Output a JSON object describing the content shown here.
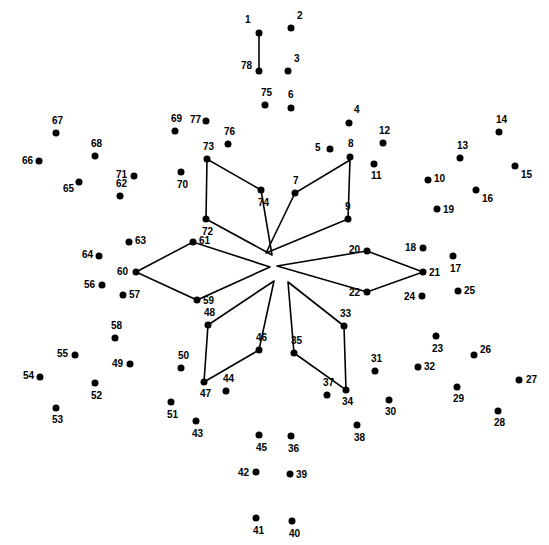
{
  "page": {
    "width": 549,
    "height": 545,
    "background_color": "#ffffff",
    "dot_color": "#000000",
    "line_color": "#000000",
    "label_color": "#000000"
  },
  "dots": [
    {
      "n": "1",
      "x": 259,
      "y": 33,
      "lx": -14,
      "ly": -13
    },
    {
      "n": "2",
      "x": 291,
      "y": 28,
      "lx": 6,
      "ly": -12
    },
    {
      "n": "3",
      "x": 288,
      "y": 71,
      "lx": 6,
      "ly": -12
    },
    {
      "n": "4",
      "x": 349,
      "y": 123,
      "lx": 5,
      "ly": -13
    },
    {
      "n": "5",
      "x": 330,
      "y": 149,
      "lx": -15,
      "ly": -1
    },
    {
      "n": "6",
      "x": 291,
      "y": 108,
      "lx": -3,
      "ly": -13
    },
    {
      "n": "7",
      "x": 295,
      "y": 193,
      "lx": -2,
      "ly": -12
    },
    {
      "n": "8",
      "x": 350,
      "y": 157,
      "lx": -2,
      "ly": -13
    },
    {
      "n": "9",
      "x": 348,
      "y": 219,
      "lx": -3,
      "ly": -12
    },
    {
      "n": "10",
      "x": 428,
      "y": 180,
      "lx": 6,
      "ly": -1
    },
    {
      "n": "11",
      "x": 374,
      "y": 164,
      "lx": -3,
      "ly": 12
    },
    {
      "n": "12",
      "x": 383,
      "y": 143,
      "lx": -4,
      "ly": -12
    },
    {
      "n": "13",
      "x": 460,
      "y": 158,
      "lx": -3,
      "ly": -12
    },
    {
      "n": "14",
      "x": 499,
      "y": 132,
      "lx": -3,
      "ly": -12
    },
    {
      "n": "15",
      "x": 515,
      "y": 166,
      "lx": 6,
      "ly": 9
    },
    {
      "n": "16",
      "x": 476,
      "y": 190,
      "lx": 6,
      "ly": 9
    },
    {
      "n": "17",
      "x": 453,
      "y": 256,
      "lx": -3,
      "ly": 13
    },
    {
      "n": "18",
      "x": 423,
      "y": 248,
      "lx": -18,
      "ly": 0
    },
    {
      "n": "19",
      "x": 437,
      "y": 209,
      "lx": 6,
      "ly": 1
    },
    {
      "n": "20",
      "x": 367,
      "y": 251,
      "lx": -18,
      "ly": -1
    },
    {
      "n": "21",
      "x": 423,
      "y": 272,
      "lx": 6,
      "ly": 1
    },
    {
      "n": "22",
      "x": 367,
      "y": 292,
      "lx": -18,
      "ly": 1
    },
    {
      "n": "23",
      "x": 436,
      "y": 336,
      "lx": -4,
      "ly": 13
    },
    {
      "n": "24",
      "x": 422,
      "y": 296,
      "lx": -18,
      "ly": 1
    },
    {
      "n": "25",
      "x": 458,
      "y": 291,
      "lx": 6,
      "ly": 0
    },
    {
      "n": "26",
      "x": 474,
      "y": 355,
      "lx": 6,
      "ly": -5
    },
    {
      "n": "27",
      "x": 519,
      "y": 380,
      "lx": 7,
      "ly": 0
    },
    {
      "n": "28",
      "x": 498,
      "y": 411,
      "lx": -4,
      "ly": 12
    },
    {
      "n": "29",
      "x": 457,
      "y": 387,
      "lx": -4,
      "ly": 12
    },
    {
      "n": "30",
      "x": 389,
      "y": 400,
      "lx": -4,
      "ly": 12
    },
    {
      "n": "31",
      "x": 375,
      "y": 371,
      "lx": -4,
      "ly": -12
    },
    {
      "n": "32",
      "x": 418,
      "y": 367,
      "lx": 6,
      "ly": 0
    },
    {
      "n": "33",
      "x": 344,
      "y": 326,
      "lx": -4,
      "ly": -12
    },
    {
      "n": "34",
      "x": 346,
      "y": 390,
      "lx": -4,
      "ly": 12
    },
    {
      "n": "35",
      "x": 294,
      "y": 353,
      "lx": -3,
      "ly": -12
    },
    {
      "n": "36",
      "x": 291,
      "y": 436,
      "lx": -3,
      "ly": 13
    },
    {
      "n": "37",
      "x": 327,
      "y": 395,
      "lx": -4,
      "ly": -12
    },
    {
      "n": "38",
      "x": 357,
      "y": 425,
      "lx": -3,
      "ly": 13
    },
    {
      "n": "39",
      "x": 290,
      "y": 474,
      "lx": 6,
      "ly": 1
    },
    {
      "n": "40",
      "x": 292,
      "y": 521,
      "lx": -3,
      "ly": 13
    },
    {
      "n": "41",
      "x": 256,
      "y": 518,
      "lx": -3,
      "ly": 13
    },
    {
      "n": "42",
      "x": 256,
      "y": 472,
      "lx": -18,
      "ly": 1
    },
    {
      "n": "43",
      "x": 196,
      "y": 421,
      "lx": -4,
      "ly": 13
    },
    {
      "n": "44",
      "x": 226,
      "y": 391,
      "lx": -3,
      "ly": -12
    },
    {
      "n": "45",
      "x": 259,
      "y": 435,
      "lx": -3,
      "ly": 13
    },
    {
      "n": "46",
      "x": 259,
      "y": 350,
      "lx": -3,
      "ly": -12
    },
    {
      "n": "47",
      "x": 204,
      "y": 382,
      "lx": -4,
      "ly": 12
    },
    {
      "n": "48",
      "x": 208,
      "y": 325,
      "lx": -4,
      "ly": -12
    },
    {
      "n": "49",
      "x": 130,
      "y": 364,
      "lx": -18,
      "ly": 0
    },
    {
      "n": "50",
      "x": 181,
      "y": 368,
      "lx": -3,
      "ly": -12
    },
    {
      "n": "51",
      "x": 171,
      "y": 402,
      "lx": -4,
      "ly": 13
    },
    {
      "n": "52",
      "x": 95,
      "y": 383,
      "lx": -4,
      "ly": 13
    },
    {
      "n": "53",
      "x": 56,
      "y": 408,
      "lx": -4,
      "ly": 12
    },
    {
      "n": "54",
      "x": 40,
      "y": 377,
      "lx": -17,
      "ly": -1
    },
    {
      "n": "55",
      "x": 75,
      "y": 355,
      "lx": -18,
      "ly": -1
    },
    {
      "n": "56",
      "x": 102,
      "y": 285,
      "lx": -18,
      "ly": 0
    },
    {
      "n": "57",
      "x": 123,
      "y": 295,
      "lx": 6,
      "ly": 0
    },
    {
      "n": "58",
      "x": 115,
      "y": 338,
      "lx": -4,
      "ly": -12
    },
    {
      "n": "59",
      "x": 197,
      "y": 300,
      "lx": 6,
      "ly": 1
    },
    {
      "n": "60",
      "x": 136,
      "y": 272,
      "lx": -19,
      "ly": 0
    },
    {
      "n": "61",
      "x": 193,
      "y": 242,
      "lx": 6,
      "ly": -1
    },
    {
      "n": "62",
      "x": 120,
      "y": 196,
      "lx": -4,
      "ly": -12
    },
    {
      "n": "63",
      "x": 129,
      "y": 242,
      "lx": 6,
      "ly": -1
    },
    {
      "n": "64",
      "x": 99,
      "y": 256,
      "lx": -17,
      "ly": -1
    },
    {
      "n": "65",
      "x": 79,
      "y": 182,
      "lx": -16,
      "ly": 7
    },
    {
      "n": "66",
      "x": 39,
      "y": 161,
      "lx": -17,
      "ly": 0
    },
    {
      "n": "67",
      "x": 56,
      "y": 133,
      "lx": -4,
      "ly": -12
    },
    {
      "n": "68",
      "x": 95,
      "y": 156,
      "lx": -4,
      "ly": -12
    },
    {
      "n": "69",
      "x": 175,
      "y": 131,
      "lx": -4,
      "ly": -12
    },
    {
      "n": "70",
      "x": 181,
      "y": 172,
      "lx": -4,
      "ly": 13
    },
    {
      "n": "71",
      "x": 134,
      "y": 176,
      "lx": -18,
      "ly": -1
    },
    {
      "n": "72",
      "x": 206,
      "y": 219,
      "lx": -4,
      "ly": 13
    },
    {
      "n": "73",
      "x": 207,
      "y": 159,
      "lx": -4,
      "ly": -12
    },
    {
      "n": "74",
      "x": 261,
      "y": 190,
      "lx": -3,
      "ly": 13
    },
    {
      "n": "75",
      "x": 265,
      "y": 105,
      "lx": -4,
      "ly": -12
    },
    {
      "n": "76",
      "x": 228,
      "y": 144,
      "lx": -4,
      "ly": -12
    },
    {
      "n": "77",
      "x": 206,
      "y": 121,
      "lx": -16,
      "ly": -1
    },
    {
      "n": "78",
      "x": 259,
      "y": 71,
      "lx": -18,
      "ly": -5
    }
  ],
  "lines": [
    {
      "name": "stem-1-78",
      "points": "259,33 259,71"
    },
    {
      "name": "petal-upper-right-7-8-9",
      "points": "266,253 295,193 350,160 348,219 266,253"
    },
    {
      "name": "petal-right-20-21-22",
      "points": "277,266 367,251 423,272 367,292 277,266"
    },
    {
      "name": "petal-lower-right-33-34-35",
      "points": "288,282 294,353 346,390 344,326 288,282"
    },
    {
      "name": "petal-lower-left-46-47-48",
      "points": "274,281 259,350 204,382 208,325 274,281"
    },
    {
      "name": "petal-left-59-60-61",
      "points": "270,267 193,242 136,272 197,300 270,267"
    },
    {
      "name": "petal-upper-left-72-73-74",
      "points": "272,255 261,190 207,159 206,219 272,255"
    }
  ]
}
